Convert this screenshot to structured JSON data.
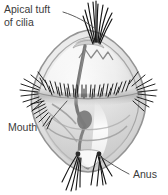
{
  "figure": {
    "background_color": "#ffffff",
    "body": {
      "outline_color": "#8d8d8d",
      "fill_light": "#f2f2f2",
      "fill_mid": "#d8d8d8",
      "fill_shadow": "#b4b4b4",
      "gut_color": "#6e6e6e",
      "cilia_color": "#1a1a1a"
    }
  },
  "labels": {
    "apical": {
      "line1": "Apical tuft",
      "line2": "of cilia",
      "x": 4,
      "y": 12
    },
    "mouth": {
      "text": "Mouth",
      "x": 8,
      "y": 131
    },
    "anus": {
      "text": "Anus",
      "x": 133,
      "y": 178
    }
  },
  "parts": [
    {
      "name": "apical-tuft-of-cilia",
      "position": "top-apex"
    },
    {
      "name": "ciliary-band",
      "position": "equator"
    },
    {
      "name": "mouth",
      "position": "left-below-band"
    },
    {
      "name": "anus",
      "position": "bottom-apex"
    },
    {
      "name": "gut",
      "position": "central-vertical"
    }
  ]
}
